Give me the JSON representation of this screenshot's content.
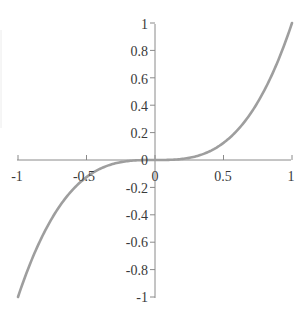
{
  "chart_data": {
    "type": "line",
    "title": "",
    "xlabel": "",
    "ylabel": "",
    "function": "y = x^3",
    "xlim": [
      -1,
      1
    ],
    "ylim": [
      -1,
      1
    ],
    "grid": false,
    "legend": null,
    "x_ticks": [
      "-1",
      "-0.5",
      "0",
      "0.5",
      "1"
    ],
    "y_ticks": [
      "1",
      "0.8",
      "0.6",
      "0.4",
      "0.2",
      "0",
      "-0.2",
      "-0.4",
      "-0.6",
      "-0.8",
      "-1"
    ],
    "series": [
      {
        "name": "y = x^3",
        "color": "#9e9e9e",
        "x": [
          -1,
          -0.9,
          -0.8,
          -0.7,
          -0.6,
          -0.5,
          -0.4,
          -0.3,
          -0.2,
          -0.1,
          0,
          0.1,
          0.2,
          0.3,
          0.4,
          0.5,
          0.6,
          0.7,
          0.8,
          0.9,
          1
        ],
        "y": [
          -1,
          -0.729,
          -0.512,
          -0.343,
          -0.216,
          -0.125,
          -0.064,
          -0.027,
          -0.008,
          -0.001,
          0,
          0.001,
          0.008,
          0.027,
          0.064,
          0.125,
          0.216,
          0.343,
          0.512,
          0.729,
          1
        ]
      }
    ]
  },
  "axes": {
    "x_labels": [
      "-1",
      "-0.5",
      "0",
      "0.5",
      "1"
    ],
    "y_labels": [
      "1",
      "0.8",
      "0.6",
      "0.4",
      "0.2",
      "0",
      "-0.2",
      "-0.4",
      "-0.6",
      "-0.8",
      "-1"
    ]
  }
}
